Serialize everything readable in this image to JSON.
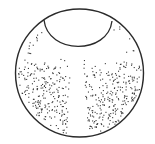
{
  "canvas": {
    "width": 155,
    "height": 144,
    "background": "#ffffff"
  },
  "colors": {
    "stroke": "#2a2a2a",
    "dot": "#3a3a3a"
  },
  "outer_circle": {
    "cx": 79.5,
    "cy": 73,
    "r": 64,
    "stroke_width": 1.4
  },
  "inner_arc": {
    "start": [
      44,
      20
    ],
    "end": [
      112,
      21
    ],
    "control_bottom_y": 49,
    "stroke_width": 1.3
  },
  "stipple": {
    "seed": 7,
    "count": 520,
    "dot_size": 1.1,
    "clear_zones": {
      "band_top_y": 22,
      "band_bottom_y": 62,
      "band_edge_fade": 14,
      "stem_center_x": 77,
      "stem_half_width_top": 5.5,
      "stem_half_width_bottom": 11,
      "stem_top_y": 58
    }
  }
}
